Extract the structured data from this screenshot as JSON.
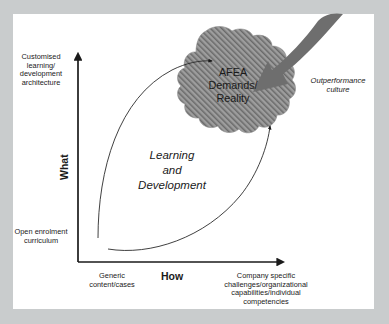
{
  "figure": {
    "type": "2x2-positioning-diagram",
    "frame_color": "#c9cccd",
    "canvas_color": "#ffffff",
    "ink_color": "#1a1a1a",
    "blob_fill": "#9a9a9a",
    "arrow_fill": "#6e6e6e"
  },
  "axes": {
    "y": {
      "name": "What",
      "high_label": "Customised\nlearning/\ndevelopment\narchitecture",
      "low_label": "Open enrolment\ncurriculum"
    },
    "x": {
      "name": "How",
      "low_label": "Generic\ncontent/cases",
      "high_label": "Company specific\nchallenges/organizational\ncapabilities/individual\ncompetencies"
    }
  },
  "regions": {
    "field": {
      "label": "Learning\nand\nDevelopment"
    },
    "blob": {
      "label": "AFEA\nDemands/\nReality",
      "pattern": "diagonal-hatch"
    }
  },
  "annotations": {
    "outperformance": "Outperformance\nculture"
  }
}
